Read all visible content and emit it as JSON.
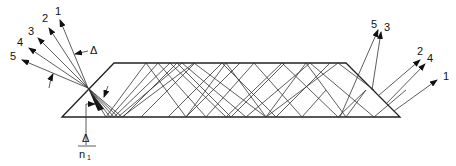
{
  "diagram": {
    "colors": {
      "ink": "#222222",
      "background": "#ffffff"
    },
    "input_rays": [
      {
        "label": "1"
      },
      {
        "label": "2"
      },
      {
        "label": "3"
      },
      {
        "label": "4"
      },
      {
        "label": "5"
      }
    ],
    "output_rays": [
      {
        "label": "5"
      },
      {
        "label": "3"
      },
      {
        "label": "2"
      },
      {
        "label": "4"
      },
      {
        "label": "1"
      }
    ],
    "angular_spread_label": "Δ",
    "internal_spread_label": {
      "numerator": "Δ",
      "denominator": "n",
      "subscript": "1"
    }
  }
}
